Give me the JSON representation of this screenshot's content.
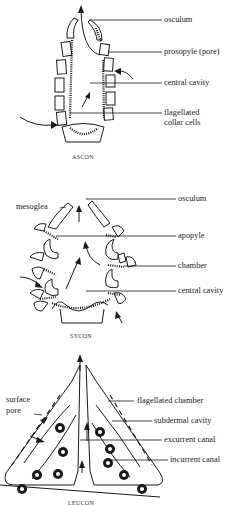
{
  "figure": {
    "panels": [
      {
        "id": "ascon",
        "caption": "ASCON",
        "labels": [
          "osculum",
          "prosopyle (pore)",
          "central cavity",
          "flagellated",
          "collar cells"
        ]
      },
      {
        "id": "sycon",
        "caption": "SYCON",
        "labels": [
          "mesoglea",
          "osculum",
          "apopyle",
          "chamber",
          "central cavity"
        ]
      },
      {
        "id": "leucon",
        "caption": "LEUCON",
        "labels": [
          "surface",
          "pore",
          "flagellated chamber",
          "subdermal cavity",
          "excurrent canal",
          "incurrent canal"
        ]
      }
    ]
  }
}
